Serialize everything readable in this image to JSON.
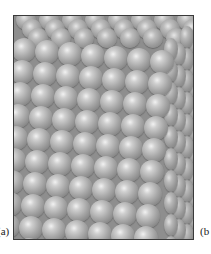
{
  "figure": {
    "label_a": "(a)",
    "label_b": "(b",
    "colors": {
      "sphere_light": "#f2f2f2",
      "sphere_mid": "#a9a9a9",
      "sphere_dark": "#6c6c6c",
      "frame": "#3a3a3a",
      "background": "#ffffff"
    },
    "lattice": {
      "front": {
        "origin_x": 10,
        "origin_y": 30,
        "col_dx": 23,
        "col_dy": 2,
        "row_dx": -2,
        "row_dy": 22,
        "cols": 7,
        "rows": 10,
        "diameter": 24
      },
      "top": {
        "origin_x": 2,
        "origin_y": -6,
        "col_dx": 23,
        "col_dy": 0,
        "row_dx": 6,
        "row_dy": 9,
        "cols": 8,
        "rows": 3,
        "diameter": 20
      },
      "side": {
        "origin_x": 150,
        "origin_y": 22,
        "col_dx": 8,
        "col_dy": -6,
        "row_dx": 0,
        "row_dy": 22,
        "cols": 5,
        "rows": 10,
        "diameter_w": 14,
        "diameter_h": 22
      }
    }
  }
}
